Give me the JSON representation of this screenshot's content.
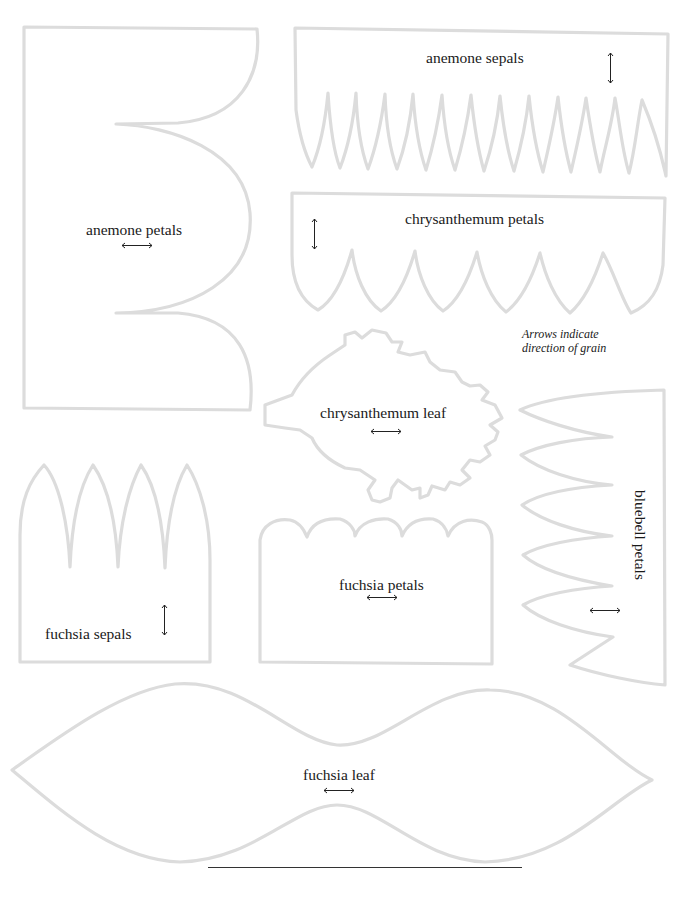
{
  "templates": [
    {
      "id": "anemone-petals",
      "label": "anemone petals",
      "grain": "horizontal"
    },
    {
      "id": "anemone-sepals",
      "label": "anemone sepals",
      "grain": "vertical"
    },
    {
      "id": "chrysanthemum-petals",
      "label": "chrysanthemum petals",
      "grain": "vertical"
    },
    {
      "id": "chrysanthemum-leaf",
      "label": "chrysanthemum leaf",
      "grain": "horizontal"
    },
    {
      "id": "bluebell-petals",
      "label": "bluebell petals",
      "grain": "horizontal"
    },
    {
      "id": "fuchsia-sepals",
      "label": "fuchsia sepals",
      "grain": "vertical"
    },
    {
      "id": "fuchsia-petals",
      "label": "fuchsia petals",
      "grain": "horizontal"
    },
    {
      "id": "fuchsia-leaf",
      "label": "fuchsia leaf",
      "grain": "horizontal"
    }
  ],
  "note": {
    "line1": "Arrows indicate",
    "line2": "direction of grain"
  },
  "colors": {
    "outline": "#dcdcdc",
    "text": "#1a1a1a"
  }
}
